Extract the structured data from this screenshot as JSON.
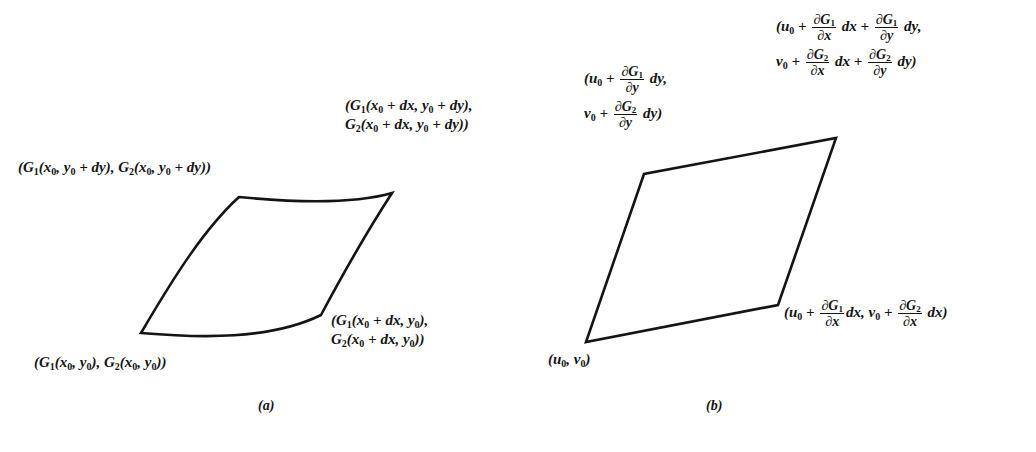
{
  "figure": {
    "panel_a": {
      "caption": "(a)",
      "corner_labels": {
        "top_left": "(G₁(x₀, y₀ + dy), G₂(x₀, y₀ + dy))",
        "top_right_line1": "(G₁(x₀ + dx, y₀ + dy),",
        "top_right_line2": "G₂(x₀ + dx, y₀ + dy))",
        "bottom_right_line1": "(G₁(x₀ + dx, y₀),",
        "bottom_right_line2": "G₂(x₀ + dx, y₀))",
        "bottom_left": "(G₁(x₀, y₀), G₂(x₀, y₀))"
      },
      "shape": "curved quadrilateral",
      "vertices": {
        "bottom_left": [
          141,
          333
        ],
        "top_left": [
          239,
          197
        ],
        "top_right": [
          392,
          193
        ],
        "bottom_right": [
          321,
          315
        ]
      }
    },
    "panel_b": {
      "caption": "(b)",
      "corner_labels": {
        "top_left_line1": "(u₀ + ∂G₁/∂y dy,",
        "top_left_line2": "v₀ + ∂G₂/∂y dy)",
        "top_right_line1": "(u₀ + ∂G₁/∂x dx + ∂G₁/∂y dy,",
        "top_right_line2": "v₀ + ∂G₂/∂x dx + ∂G₂/∂y dy)",
        "bottom_right": "(u₀ + ∂G₁/∂x dx, v₀ + ∂G₂/∂x dx)",
        "bottom_left": "(u₀, v₀)"
      },
      "shape": "parallelogram",
      "vertices": {
        "bottom_left": [
          586,
          342
        ],
        "top_left": [
          644,
          174
        ],
        "top_right": [
          836,
          138
        ],
        "bottom_right": [
          778,
          305
        ]
      }
    },
    "symbols": {
      "partial": "∂",
      "plus": "+",
      "comma": ",",
      "G1": "G",
      "G2": "G",
      "sub1": "1",
      "sub2": "2",
      "sub0": "0",
      "x": "x",
      "y": "y",
      "u": "u",
      "v": "v",
      "dx": "dx",
      "dy": "dy"
    },
    "stroke_color": "#141414",
    "background_color": "#ffffff"
  }
}
